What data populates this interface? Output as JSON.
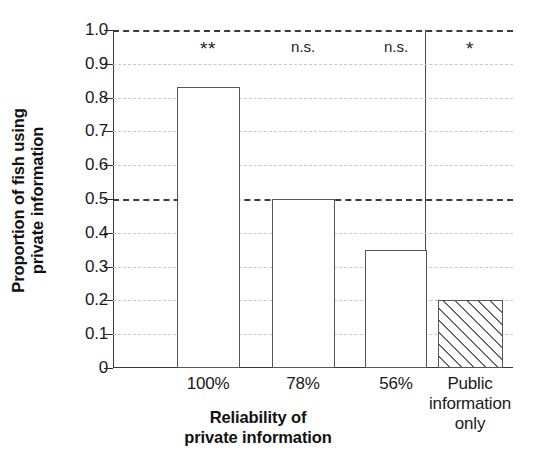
{
  "chart_data": {
    "type": "bar",
    "title": "",
    "xlabel": "Reliability of private information",
    "xlabel_lines": [
      "Reliability of",
      "private information"
    ],
    "ylabel": "Proportion of fish using private information",
    "ylabel_lines": [
      "Proportion of fish using",
      "private information"
    ],
    "categories": [
      "100%",
      "78%",
      "56%",
      "Public information only"
    ],
    "category_label_lines": [
      [
        "100%"
      ],
      [
        "78%"
      ],
      [
        "56%"
      ],
      [
        "Public",
        "information",
        "only"
      ]
    ],
    "values": [
      0.83,
      0.5,
      0.35,
      0.2
    ],
    "annotations": [
      "**",
      "n.s.",
      "n.s.",
      "*"
    ],
    "bar_styles": [
      "open",
      "open",
      "open",
      "hatched"
    ],
    "ylim": [
      0,
      1.0
    ],
    "yticks": [
      0,
      0.1,
      0.2,
      0.3,
      0.4,
      0.5,
      0.6,
      0.7,
      0.8,
      0.9,
      1.0
    ],
    "ytick_labels": [
      "0",
      "0.1",
      "0.2",
      "0.3",
      "0.4",
      "0.5",
      "0.6",
      "0.7",
      "0.8",
      "0.9",
      "1.0"
    ],
    "emphasized_gridlines": [
      0.5,
      1.0
    ],
    "grid": true,
    "legend": "none",
    "separator_after_category_index": 2,
    "colors": {
      "bar_fill": "#ffffff",
      "bar_edge": "#555555",
      "hatch": "#6a6a6a",
      "grid": "#c9c9c9",
      "grid_emphasis": "#3a3a3a",
      "axis": "#3a3a3a",
      "text": "#1a1a1a"
    }
  }
}
